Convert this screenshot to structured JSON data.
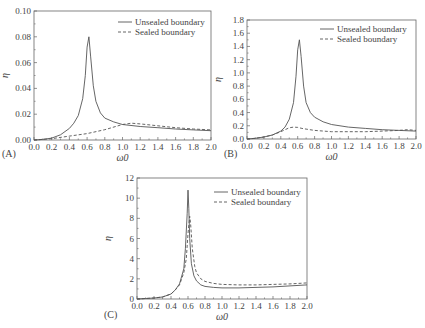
{
  "figure": {
    "panels": [
      "(A)",
      "(B)",
      "(C)"
    ]
  },
  "chart_data": [
    {
      "type": "line",
      "panel_label": "(A)",
      "xlabel": "ω0",
      "ylabel": "η",
      "xlim": [
        0.0,
        2.0
      ],
      "ylim": [
        0.0,
        0.1
      ],
      "xticks": [
        "0.0",
        "0.2",
        "0.4",
        "0.6",
        "0.8",
        "1.0",
        "1.2",
        "1.4",
        "1.6",
        "1.8",
        "2.0"
      ],
      "yticks": [
        "0.00",
        "0.02",
        "0.04",
        "0.06",
        "0.08",
        "0.10"
      ],
      "legend_position": "upper right",
      "series": [
        {
          "name": "Unsealed boundary",
          "style": "solid",
          "x": [
            0.0,
            0.1,
            0.2,
            0.3,
            0.4,
            0.45,
            0.5,
            0.55,
            0.58,
            0.6,
            0.62,
            0.64,
            0.67,
            0.7,
            0.75,
            0.8,
            0.9,
            1.0,
            1.2,
            1.4,
            1.6,
            1.8,
            2.0
          ],
          "y": [
            0.0,
            0.0005,
            0.0015,
            0.004,
            0.009,
            0.013,
            0.019,
            0.032,
            0.05,
            0.072,
            0.08,
            0.065,
            0.042,
            0.03,
            0.021,
            0.017,
            0.014,
            0.012,
            0.0105,
            0.0095,
            0.0085,
            0.0078,
            0.0072
          ]
        },
        {
          "name": "Sealed boundary",
          "style": "dashed",
          "x": [
            0.0,
            0.2,
            0.4,
            0.6,
            0.8,
            1.0,
            1.1,
            1.2,
            1.4,
            1.6,
            1.8,
            2.0
          ],
          "y": [
            0.0,
            0.001,
            0.003,
            0.005,
            0.008,
            0.012,
            0.013,
            0.0125,
            0.011,
            0.0095,
            0.0085,
            0.0078
          ]
        }
      ]
    },
    {
      "type": "line",
      "panel_label": "(B)",
      "xlabel": "ω0",
      "ylabel": "η",
      "xlim": [
        0.0,
        2.0
      ],
      "ylim": [
        0.0,
        1.8
      ],
      "xticks": [
        "0.0",
        "0.2",
        "0.4",
        "0.6",
        "0.8",
        "1.0",
        "1.2",
        "1.4",
        "1.6",
        "1.8",
        "2.0"
      ],
      "yticks": [
        "0.0",
        "0.2",
        "0.4",
        "0.6",
        "0.8",
        "1.0",
        "1.2",
        "1.4",
        "1.6",
        "1.8"
      ],
      "legend_position": "upper right",
      "series": [
        {
          "name": "Unsealed boundary",
          "style": "solid",
          "x": [
            0.0,
            0.1,
            0.2,
            0.3,
            0.4,
            0.45,
            0.5,
            0.55,
            0.58,
            0.6,
            0.62,
            0.64,
            0.67,
            0.7,
            0.75,
            0.8,
            0.9,
            1.0,
            1.2,
            1.4,
            1.6,
            1.8,
            2.0
          ],
          "y": [
            0.0,
            0.01,
            0.03,
            0.06,
            0.12,
            0.18,
            0.3,
            0.55,
            0.95,
            1.35,
            1.5,
            1.25,
            0.8,
            0.55,
            0.4,
            0.33,
            0.26,
            0.22,
            0.18,
            0.16,
            0.14,
            0.13,
            0.12
          ]
        },
        {
          "name": "Sealed boundary",
          "style": "dashed",
          "x": [
            0.0,
            0.1,
            0.2,
            0.3,
            0.4,
            0.45,
            0.5,
            0.55,
            0.6,
            0.65,
            0.7,
            0.8,
            1.0,
            1.2,
            1.4,
            1.6,
            1.8,
            1.9,
            2.0
          ],
          "y": [
            0.0,
            0.01,
            0.03,
            0.06,
            0.11,
            0.14,
            0.17,
            0.18,
            0.175,
            0.16,
            0.15,
            0.13,
            0.11,
            0.11,
            0.11,
            0.12,
            0.13,
            0.14,
            0.13
          ]
        }
      ]
    },
    {
      "type": "line",
      "panel_label": "(C)",
      "xlabel": "ω0",
      "ylabel": "η",
      "xlim": [
        0.0,
        2.0
      ],
      "ylim": [
        0,
        12
      ],
      "xticks": [
        "0.0",
        "0.2",
        "0.4",
        "0.6",
        "0.8",
        "1.0",
        "1.2",
        "1.4",
        "1.6",
        "1.8",
        "2.0"
      ],
      "yticks": [
        "0",
        "2",
        "4",
        "6",
        "8",
        "10",
        "12"
      ],
      "legend_position": "upper right",
      "series": [
        {
          "name": "Unsealed boundary",
          "style": "solid",
          "x": [
            0.0,
            0.1,
            0.2,
            0.3,
            0.4,
            0.45,
            0.5,
            0.55,
            0.57,
            0.59,
            0.6,
            0.61,
            0.62,
            0.64,
            0.67,
            0.7,
            0.75,
            0.8,
            0.9,
            1.0,
            1.2,
            1.4,
            1.6,
            1.8,
            2.0
          ],
          "y": [
            0.0,
            0.05,
            0.1,
            0.2,
            0.5,
            0.9,
            1.5,
            3.0,
            5.0,
            8.5,
            10.8,
            9.0,
            6.0,
            3.5,
            2.3,
            1.8,
            1.4,
            1.25,
            1.15,
            1.1,
            1.1,
            1.15,
            1.2,
            1.3,
            1.4
          ]
        },
        {
          "name": "Sealed boundary",
          "style": "dashed",
          "x": [
            0.0,
            0.1,
            0.2,
            0.3,
            0.4,
            0.45,
            0.5,
            0.55,
            0.58,
            0.6,
            0.62,
            0.63,
            0.65,
            0.68,
            0.7,
            0.75,
            0.8,
            0.9,
            1.0,
            1.2,
            1.4,
            1.6,
            1.8,
            2.0
          ],
          "y": [
            0.0,
            0.05,
            0.1,
            0.2,
            0.5,
            0.9,
            1.4,
            2.6,
            4.0,
            6.5,
            8.2,
            7.5,
            5.0,
            3.2,
            2.6,
            2.0,
            1.75,
            1.55,
            1.45,
            1.4,
            1.4,
            1.45,
            1.5,
            1.6
          ]
        }
      ]
    }
  ]
}
